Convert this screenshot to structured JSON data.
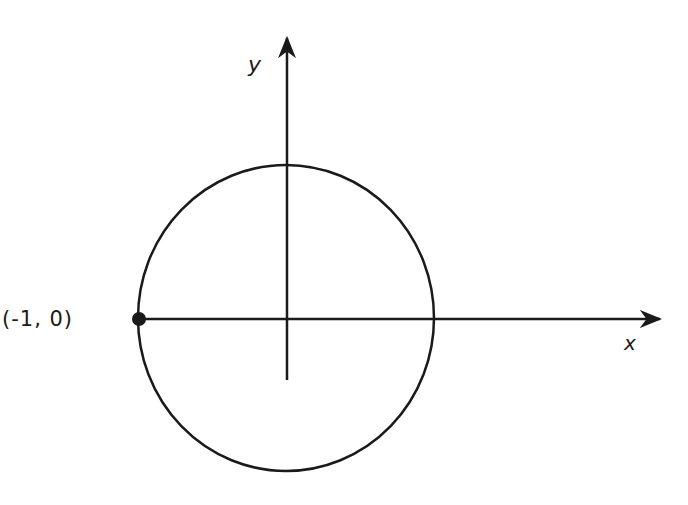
{
  "figure": {
    "type": "unit-circle-diagram",
    "axes": {
      "x_label": "x",
      "y_label": "y"
    },
    "point": {
      "label": "(-1, 0)",
      "coords": [
        -1,
        0
      ]
    },
    "colors": {
      "ink": "#1a1a1a",
      "background": "#ffffff"
    }
  }
}
